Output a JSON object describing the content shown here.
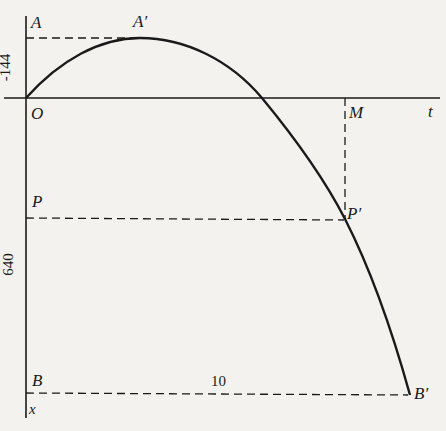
{
  "figure": {
    "type": "displacement-time parabola diagram",
    "colors": {
      "ink": "#1a1a1a",
      "paper": "#f3f2ef"
    },
    "axes": {
      "horizontal_label": "t",
      "vertical_label": "x",
      "origin_label": "O"
    },
    "points": {
      "A": "A",
      "A_prime": "A′",
      "M": "M",
      "P": "P",
      "P_prime": "P′",
      "B": "B",
      "B_prime": "B′"
    },
    "dimensions": {
      "max_height": "-144",
      "depth_at_P": "640",
      "duration": "10"
    }
  }
}
